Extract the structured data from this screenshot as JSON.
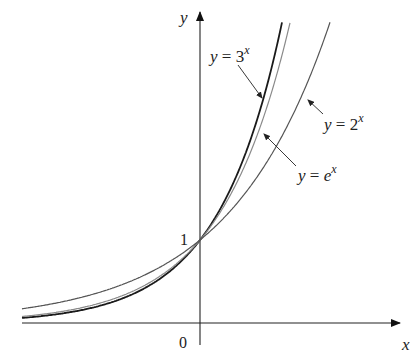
{
  "chart_data": {
    "type": "line",
    "title": "",
    "xlabel": "x",
    "ylabel": "y",
    "origin_label": "0",
    "y_tick_label": "1",
    "xlim": [
      -2.5,
      2.95
    ],
    "ylim": [
      -0.3,
      3.9
    ],
    "grid": false,
    "legend": "annotations",
    "series": [
      {
        "name": "y = 3^x",
        "base": 3,
        "color": "#1a1a1a",
        "width": 1.8
      },
      {
        "name": "y = e^x",
        "base": 2.718281828,
        "color": "#8a8a8a",
        "width": 1.2
      },
      {
        "name": "y = 2^x",
        "base": 2,
        "color": "#555555",
        "width": 1.2
      }
    ],
    "annotations": [
      {
        "text_base": "y = 3",
        "sup": "x",
        "target": "y = 3^x"
      },
      {
        "text_base": "y = 2",
        "sup": "x",
        "target": "y = 2^x"
      },
      {
        "text_base": "y = e",
        "sup": "x",
        "target": "y = e^x"
      }
    ],
    "intersection_point": [
      0,
      1
    ]
  }
}
